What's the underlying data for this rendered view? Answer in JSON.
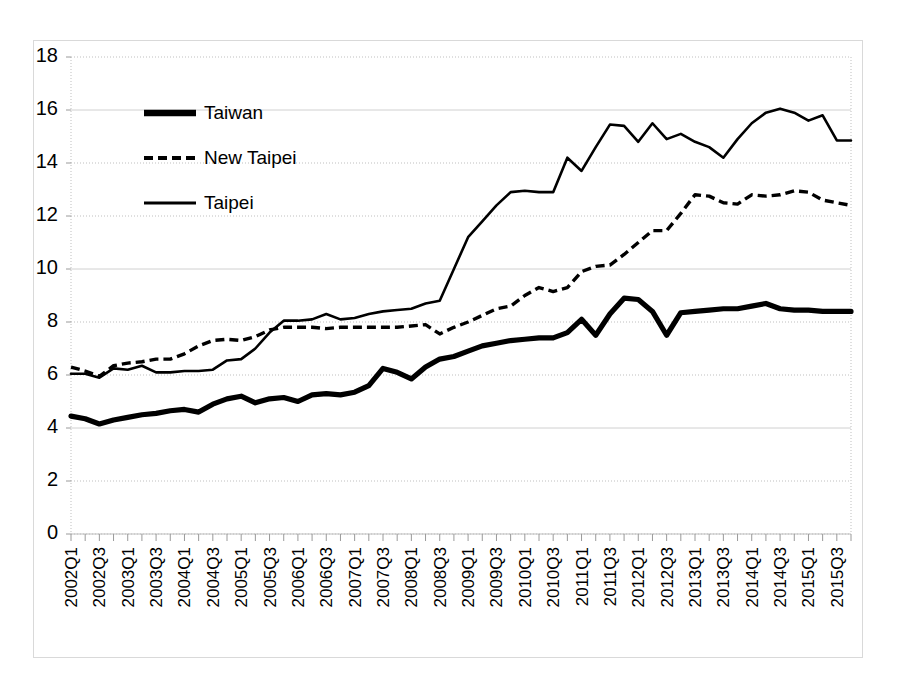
{
  "chart_data": {
    "type": "line",
    "title": "",
    "subtitle": "",
    "xlabel": "",
    "ylabel": "",
    "ylim": [
      0,
      18
    ],
    "ytick_step": 2,
    "yticks": [
      "0",
      "2",
      "4",
      "6",
      "8",
      "10",
      "12",
      "14",
      "16",
      "18"
    ],
    "grid": true,
    "legend_position": "upper-left-inside",
    "x": [
      "2002Q1",
      "2002Q2",
      "2002Q3",
      "2002Q4",
      "2003Q1",
      "2003Q2",
      "2003Q3",
      "2003Q4",
      "2004Q1",
      "2004Q2",
      "2004Q3",
      "2004Q4",
      "2005Q1",
      "2005Q2",
      "2005Q3",
      "2005Q4",
      "2006Q1",
      "2006Q2",
      "2006Q3",
      "2006Q4",
      "2007Q1",
      "2007Q2",
      "2007Q3",
      "2007Q4",
      "2008Q1",
      "2008Q2",
      "2008Q3",
      "2008Q4",
      "2009Q1",
      "2009Q2",
      "2009Q3",
      "2009Q4",
      "2010Q1",
      "2010Q2",
      "2010Q3",
      "2010Q4",
      "2011Q1",
      "2011Q2",
      "2011Q3",
      "2011Q4",
      "2012Q1",
      "2012Q2",
      "2012Q3",
      "2012Q4",
      "2013Q1",
      "2013Q2",
      "2013Q3",
      "2013Q4",
      "2014Q1",
      "2014Q2",
      "2014Q3",
      "2014Q4",
      "2015Q1",
      "2015Q2",
      "2015Q3",
      "2015Q4"
    ],
    "xtick_labels": [
      "2002Q1",
      "2002Q3",
      "2003Q1",
      "2003Q3",
      "2004Q1",
      "2004Q3",
      "2005Q1",
      "2005Q3",
      "2006Q1",
      "2006Q3",
      "2007Q1",
      "2007Q3",
      "2008Q1",
      "2008Q3",
      "2009Q1",
      "2009Q3",
      "2010Q1",
      "2010Q3",
      "2011Q1",
      "2011Q3",
      "2012Q1",
      "2012Q3",
      "2013Q1",
      "2013Q3",
      "2014Q1",
      "2014Q3",
      "2015Q1",
      "2015Q3"
    ],
    "series": [
      {
        "name": "Taiwan",
        "style": "thick-solid",
        "values": [
          4.45,
          4.35,
          4.15,
          4.3,
          4.4,
          4.5,
          4.55,
          4.65,
          4.7,
          4.6,
          4.9,
          5.1,
          5.2,
          4.95,
          5.1,
          5.15,
          5.0,
          5.25,
          5.3,
          5.25,
          5.35,
          5.6,
          6.25,
          6.1,
          5.85,
          6.3,
          6.6,
          6.7,
          6.9,
          7.1,
          7.2,
          7.3,
          7.35,
          7.4,
          7.4,
          7.6,
          8.1,
          7.5,
          8.3,
          8.9,
          8.85,
          8.4,
          7.5,
          8.35,
          8.4,
          8.45,
          8.5,
          8.5,
          8.6,
          8.7,
          8.5,
          8.45,
          8.45,
          8.4,
          8.4,
          8.4
        ]
      },
      {
        "name": "New Taipei",
        "style": "dashed",
        "values": [
          6.3,
          6.15,
          5.95,
          6.35,
          6.45,
          6.5,
          6.6,
          6.6,
          6.8,
          7.1,
          7.3,
          7.35,
          7.3,
          7.45,
          7.7,
          7.8,
          7.8,
          7.8,
          7.75,
          7.8,
          7.8,
          7.8,
          7.8,
          7.8,
          7.85,
          7.9,
          7.55,
          7.8,
          8.0,
          8.25,
          8.5,
          8.6,
          9.0,
          9.3,
          9.15,
          9.3,
          9.9,
          10.1,
          10.15,
          10.55,
          11.0,
          11.45,
          11.45,
          12.1,
          12.8,
          12.75,
          12.5,
          12.45,
          12.8,
          12.75,
          12.8,
          12.95,
          12.9,
          12.6,
          12.5,
          12.4
        ]
      },
      {
        "name": "Taipei",
        "style": "thin-solid",
        "values": [
          6.05,
          6.05,
          5.9,
          6.25,
          6.2,
          6.35,
          6.1,
          6.1,
          6.15,
          6.15,
          6.2,
          6.55,
          6.6,
          7.0,
          7.6,
          8.05,
          8.05,
          8.1,
          8.3,
          8.1,
          8.15,
          8.3,
          8.4,
          8.45,
          8.5,
          8.7,
          8.8,
          10.0,
          11.2,
          11.8,
          12.4,
          12.9,
          12.95,
          12.9,
          12.9,
          14.2,
          13.7,
          14.6,
          15.45,
          15.4,
          14.8,
          15.5,
          14.9,
          15.1,
          14.8,
          14.6,
          14.2,
          14.9,
          15.5,
          15.9,
          16.05,
          15.9,
          15.6,
          15.8,
          14.85,
          14.85
        ]
      }
    ]
  },
  "legend": {
    "items": [
      {
        "label": "Taiwan"
      },
      {
        "label": "New Taipei"
      },
      {
        "label": "Taipei"
      }
    ]
  }
}
